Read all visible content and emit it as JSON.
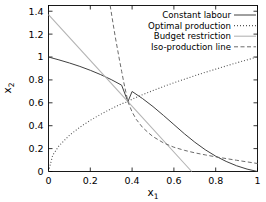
{
  "chart_data": {
    "type": "line",
    "title": "",
    "xlabel": "x_1",
    "ylabel": "x_2",
    "xlim": [
      0,
      1
    ],
    "ylim": [
      0,
      1.45
    ],
    "xticks": [
      "0",
      "0.2",
      "0.4",
      "0.6",
      "0.8",
      "1"
    ],
    "xtick_values": [
      0,
      0.2,
      0.4,
      0.6,
      0.8,
      1
    ],
    "yticks": [
      "0",
      "0.2",
      "0.4",
      "0.6",
      "0.8",
      "1",
      "1.2",
      "1.4"
    ],
    "ytick_values": [
      0,
      0.2,
      0.4,
      0.6,
      0.8,
      1,
      1.2,
      1.4
    ],
    "grid": false,
    "legend_position": "top-right",
    "intersection_point": [
      0.38,
      0.61
    ],
    "series": [
      {
        "name": "Constant labour",
        "style": "solid",
        "color": "#404040",
        "points": [
          [
            0.0,
            1.0
          ],
          [
            0.05,
            0.975
          ],
          [
            0.1,
            0.948
          ],
          [
            0.15,
            0.918
          ],
          [
            0.2,
            0.884
          ],
          [
            0.25,
            0.846
          ],
          [
            0.3,
            0.803
          ],
          [
            0.35,
            0.754
          ],
          [
            0.38,
            0.61
          ],
          [
            0.4,
            0.699
          ],
          [
            0.45,
            0.637
          ],
          [
            0.5,
            0.567
          ],
          [
            0.55,
            0.49
          ],
          [
            0.6,
            0.41
          ],
          [
            0.65,
            0.33
          ],
          [
            0.7,
            0.256
          ],
          [
            0.75,
            0.19
          ],
          [
            0.8,
            0.134
          ],
          [
            0.85,
            0.088
          ],
          [
            0.9,
            0.05
          ],
          [
            0.95,
            0.021
          ],
          [
            1.0,
            0.0
          ]
        ]
      },
      {
        "name": "Optimal production",
        "style": "dotted",
        "color": "#555555",
        "points": [
          [
            0.0,
            0.0
          ],
          [
            0.02,
            0.141
          ],
          [
            0.05,
            0.224
          ],
          [
            0.1,
            0.316
          ],
          [
            0.15,
            0.387
          ],
          [
            0.2,
            0.447
          ],
          [
            0.25,
            0.5
          ],
          [
            0.3,
            0.548
          ],
          [
            0.35,
            0.592
          ],
          [
            0.38,
            0.61
          ],
          [
            0.4,
            0.632
          ],
          [
            0.45,
            0.671
          ],
          [
            0.5,
            0.707
          ],
          [
            0.55,
            0.742
          ],
          [
            0.6,
            0.775
          ],
          [
            0.65,
            0.806
          ],
          [
            0.7,
            0.837
          ],
          [
            0.75,
            0.866
          ],
          [
            0.8,
            0.894
          ],
          [
            0.85,
            0.922
          ],
          [
            0.9,
            0.949
          ],
          [
            0.95,
            0.975
          ],
          [
            1.0,
            1.0
          ]
        ]
      },
      {
        "name": "Budget restriction",
        "style": "solid-light",
        "color": "#b4b4b4",
        "points": [
          [
            0.0,
            1.37
          ],
          [
            0.38,
            0.61
          ],
          [
            0.685,
            0.0
          ]
        ]
      },
      {
        "name": "Iso-production line",
        "style": "dashed",
        "color": "#6b6b6b",
        "points": [
          [
            0.295,
            1.45
          ],
          [
            0.31,
            1.28
          ],
          [
            0.32,
            1.17
          ],
          [
            0.33,
            1.07
          ],
          [
            0.34,
            0.97
          ],
          [
            0.35,
            0.875
          ],
          [
            0.36,
            0.78
          ],
          [
            0.37,
            0.695
          ],
          [
            0.38,
            0.61
          ],
          [
            0.4,
            0.52
          ],
          [
            0.42,
            0.455
          ],
          [
            0.45,
            0.385
          ],
          [
            0.48,
            0.335
          ],
          [
            0.5,
            0.305
          ],
          [
            0.55,
            0.25
          ],
          [
            0.6,
            0.212
          ],
          [
            0.65,
            0.185
          ],
          [
            0.7,
            0.163
          ],
          [
            0.75,
            0.145
          ],
          [
            0.8,
            0.128
          ],
          [
            0.85,
            0.113
          ],
          [
            0.9,
            0.098
          ],
          [
            0.95,
            0.084
          ],
          [
            1.0,
            0.07
          ]
        ]
      }
    ]
  },
  "legend": {
    "entries": [
      {
        "label": "Constant labour",
        "style": "solid",
        "color": "#404040"
      },
      {
        "label": "Optimal production",
        "style": "dotted",
        "color": "#555555"
      },
      {
        "label": "Budget restriction",
        "style": "solid-light",
        "color": "#b4b4b4"
      },
      {
        "label": "Iso-production line",
        "style": "dashed",
        "color": "#6b6b6b"
      }
    ]
  },
  "axes": {
    "xlabel_base": "x",
    "xlabel_sub": "1",
    "ylabel_base": "x",
    "ylabel_sub": "2"
  }
}
